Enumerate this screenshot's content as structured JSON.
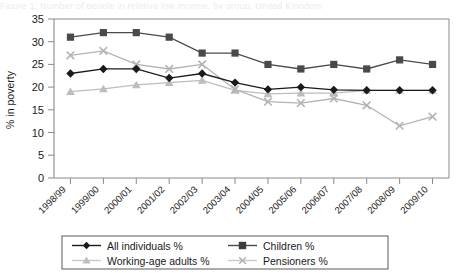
{
  "chart_data": {
    "type": "line",
    "title": "",
    "xlabel": "",
    "ylabel": "% in poverty",
    "ylim": [
      0,
      35
    ],
    "ytick_step": 5,
    "yticks": [
      "0",
      "5",
      "10",
      "15",
      "20",
      "25",
      "30",
      "35"
    ],
    "grid": false,
    "legend_position": "bottom",
    "categories": [
      "1998/99",
      "1999/00",
      "2000/01",
      "2001/02",
      "2002/03",
      "2003/04",
      "2004/05",
      "2005/06",
      "2006/07",
      "2007/08",
      "2008/09",
      "2009/10"
    ],
    "series": [
      {
        "name": "All individuals %",
        "marker": "diamond",
        "color": "#1a1a1a",
        "values": [
          23,
          24,
          24,
          22,
          23,
          21,
          19.5,
          20,
          19.4,
          19.3,
          19.3,
          19.3
        ]
      },
      {
        "name": "Children %",
        "marker": "square",
        "color": "#4a4a4a",
        "values": [
          31,
          32,
          32,
          31,
          27.5,
          27.5,
          25,
          24,
          25,
          24,
          26,
          25
        ]
      },
      {
        "name": "Working-age adults %",
        "marker": "triangle",
        "color": "#bdbdbd",
        "values": [
          19,
          19.6,
          20.5,
          21,
          21.5,
          19.3,
          18.5,
          18.7,
          18.7,
          19.3,
          19.3,
          19.3
        ]
      },
      {
        "name": "Pensioners %",
        "marker": "x",
        "color": "#b3b3b3",
        "values": [
          27,
          28,
          25,
          24,
          25,
          19.5,
          16.8,
          16.5,
          17.5,
          16,
          11.5,
          13.5
        ]
      }
    ]
  },
  "legend": {
    "items": [
      {
        "label": "All individuals %"
      },
      {
        "label": "Children %"
      },
      {
        "label": "Working-age adults %"
      },
      {
        "label": "Pensioners %"
      }
    ]
  },
  "artifacts": {
    "clipped_caption": "Figure 1: Number of people in relative low income, by group, United Kingdom"
  }
}
